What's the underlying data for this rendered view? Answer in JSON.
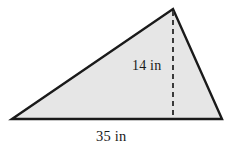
{
  "figure": {
    "kind": "triangle-with-height",
    "background_color": "#ffffff",
    "fill_color": "#e6e6e6",
    "stroke_color": "#1a1a1a",
    "stroke_width": 2.4,
    "dash_color": "#3a3a3a",
    "dash_pattern": "5,4",
    "vertices": {
      "bottom_left": [
        12,
        119
      ],
      "apex": [
        173,
        9
      ],
      "bottom_right": [
        222,
        119
      ]
    },
    "height_line": {
      "from": [
        173,
        11
      ],
      "to": [
        173,
        119
      ]
    }
  },
  "labels": {
    "height": "14 in",
    "base": "35 in"
  },
  "chart_data": {
    "type": "diagram",
    "shape": "triangle",
    "measurements": [
      {
        "name": "height",
        "value": 14,
        "unit": "in",
        "label": "14 in"
      },
      {
        "name": "base",
        "value": 35,
        "unit": "in",
        "label": "35 in"
      }
    ]
  }
}
